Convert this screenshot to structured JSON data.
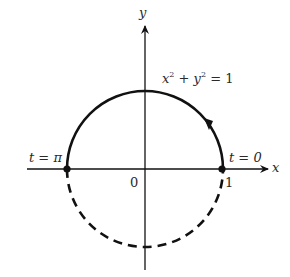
{
  "diagram": {
    "axes": {
      "x_label": "x",
      "y_label": "y",
      "origin_label": "0",
      "tick_label_x": "1"
    },
    "equation": {
      "x": "x",
      "exp1": "2",
      "plus": " + ",
      "y": "y",
      "exp2": "2",
      "rhs": " = 1"
    },
    "points": [
      {
        "label": "t = π",
        "x": -1,
        "y": 0
      },
      {
        "label": "t = 0",
        "x": 1,
        "y": 0
      }
    ],
    "curves": {
      "upper_semicircle": {
        "style": "solid",
        "direction": "counterclockwise"
      },
      "lower_semicircle": {
        "style": "dashed"
      }
    },
    "colors": {
      "stroke": "#111111",
      "text": "#2a2a2a",
      "background": "#ffffff"
    }
  }
}
